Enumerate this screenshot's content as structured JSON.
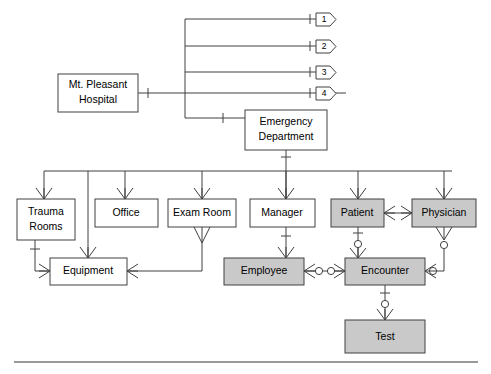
{
  "diagram": {
    "type": "entity-relationship-diagram",
    "notation": "crow's-foot",
    "colors": {
      "line": "#404040",
      "entity_fill": "#ffffff",
      "shaded_entity_fill": "#c9c9c9",
      "text": "#000000",
      "footer_rule": "#777777"
    }
  },
  "entities": [
    {
      "id": "hospital",
      "label_line1": "Mt. Pleasant",
      "label_line2": "Hospital",
      "shaded": false,
      "x": 58,
      "y": 74,
      "w": 80,
      "h": 38
    },
    {
      "id": "emergency_department",
      "label_line1": "Emergency",
      "label_line2": "Department",
      "shaded": false,
      "x": 245,
      "y": 110,
      "w": 82,
      "h": 40
    },
    {
      "id": "trauma_rooms",
      "label_line1": "Trauma",
      "label_line2": "Rooms",
      "shaded": false,
      "x": 17,
      "y": 199,
      "w": 58,
      "h": 41
    },
    {
      "id": "office",
      "label_line1": "Office",
      "label_line2": "",
      "shaded": false,
      "x": 95,
      "y": 199,
      "w": 63,
      "h": 28
    },
    {
      "id": "exam_room",
      "label_line1": "Exam Room",
      "label_line2": "",
      "shaded": false,
      "x": 168,
      "y": 199,
      "w": 68,
      "h": 28
    },
    {
      "id": "manager",
      "label_line1": "Manager",
      "label_line2": "",
      "shaded": false,
      "x": 250,
      "y": 199,
      "w": 65,
      "h": 28
    },
    {
      "id": "patient",
      "label_line1": "Patient",
      "label_line2": "",
      "shaded": true,
      "x": 331,
      "y": 199,
      "w": 53,
      "h": 28
    },
    {
      "id": "physician",
      "label_line1": "Physician",
      "label_line2": "",
      "shaded": true,
      "x": 412,
      "y": 199,
      "w": 64,
      "h": 28
    },
    {
      "id": "equipment",
      "label_line1": "Equipment",
      "label_line2": "",
      "shaded": false,
      "x": 50,
      "y": 258,
      "w": 77,
      "h": 27
    },
    {
      "id": "employee",
      "label_line1": "Employee",
      "label_line2": "",
      "shaded": true,
      "x": 224,
      "y": 258,
      "w": 80,
      "h": 27
    },
    {
      "id": "encounter",
      "label_line1": "Encounter",
      "label_line2": "",
      "shaded": true,
      "x": 345,
      "y": 258,
      "w": 80,
      "h": 27
    },
    {
      "id": "test",
      "label_line1": "Test",
      "label_line2": "",
      "shaded": true,
      "x": 345,
      "y": 320,
      "w": 80,
      "h": 33
    }
  ],
  "references": [
    {
      "id": "ref-1",
      "label": "1",
      "x": 316,
      "y": 13,
      "w": 20,
      "h": 13
    },
    {
      "id": "ref-2",
      "label": "2",
      "x": 316,
      "y": 40,
      "w": 20,
      "h": 13
    },
    {
      "id": "ref-3",
      "label": "3",
      "x": 316,
      "y": 66,
      "w": 20,
      "h": 13
    },
    {
      "id": "ref-4",
      "label": "4",
      "x": 316,
      "y": 89,
      "w": 20,
      "h": 13
    }
  ],
  "relationships": [
    {
      "from": "hospital",
      "to": "ref-1",
      "from_card": "one",
      "to_card": "one"
    },
    {
      "from": "hospital",
      "to": "ref-2",
      "from_card": "one",
      "to_card": "one"
    },
    {
      "from": "hospital",
      "to": "ref-3",
      "from_card": "one",
      "to_card": "one"
    },
    {
      "from": "hospital",
      "to": "ref-4",
      "from_card": "one",
      "to_card": "one"
    },
    {
      "from": "hospital",
      "to": "emergency_department",
      "from_card": "one",
      "to_card": "one"
    },
    {
      "from": "emergency_department",
      "to": "trauma_rooms",
      "from_card": "one",
      "to_card": "many"
    },
    {
      "from": "emergency_department",
      "to": "office",
      "from_card": "one",
      "to_card": "many"
    },
    {
      "from": "emergency_department",
      "to": "exam_room",
      "from_card": "one",
      "to_card": "many"
    },
    {
      "from": "emergency_department",
      "to": "manager",
      "from_card": "one",
      "to_card": "many"
    },
    {
      "from": "emergency_department",
      "to": "patient",
      "from_card": "one",
      "to_card": "many"
    },
    {
      "from": "emergency_department",
      "to": "physician",
      "from_card": "one",
      "to_card": "many"
    },
    {
      "from": "trauma_rooms",
      "to": "equipment",
      "from_card": "one",
      "to_card": "many"
    },
    {
      "from": "exam_room",
      "to": "equipment",
      "from_card": "many",
      "to_card": "many"
    },
    {
      "from": "manager",
      "to": "employee",
      "from_card": "one",
      "to_card": "many"
    },
    {
      "from": "patient",
      "to": "encounter",
      "from_card": "one",
      "to_card": "zero-or-many"
    },
    {
      "from": "patient",
      "to": "physician",
      "from_card": "many",
      "to_card": "many"
    },
    {
      "from": "physician",
      "to": "encounter",
      "from_card": "zero-or-many",
      "to_card": "zero-or-many"
    },
    {
      "from": "employee",
      "to": "encounter",
      "from_card": "zero-or-many",
      "to_card": "zero-or-many"
    },
    {
      "from": "encounter",
      "to": "test",
      "from_card": "one",
      "to_card": "zero-or-many"
    }
  ]
}
